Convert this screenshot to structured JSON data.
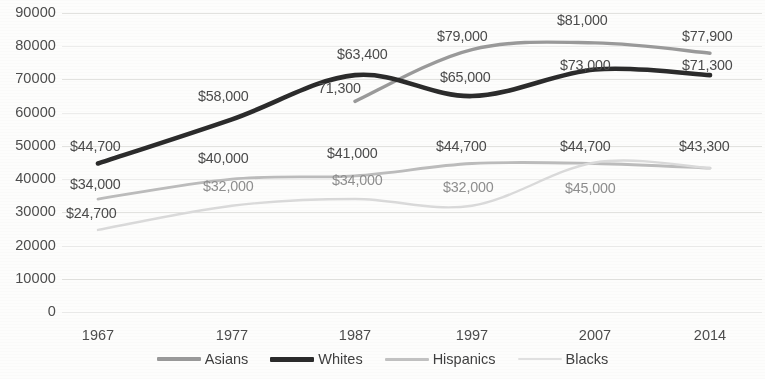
{
  "chart_data": {
    "type": "line",
    "title": "",
    "xlabel": "",
    "ylabel": "",
    "categories": [
      "1967",
      "1977",
      "1987",
      "1997",
      "2007",
      "2014"
    ],
    "ylim": [
      0,
      90000
    ],
    "ytick_values": [
      90000,
      80000,
      70000,
      60000,
      50000,
      40000,
      30000,
      20000,
      10000,
      0
    ],
    "ytick_labels": [
      "90000",
      "80000",
      "70000",
      "60000",
      "50000",
      "40000",
      "30000",
      "20000",
      "10000",
      "0"
    ],
    "grid": true,
    "legend_position": "bottom",
    "series": [
      {
        "name": "Asians",
        "color": "#9a9a9a",
        "width": 3.4,
        "values": [
          null,
          null,
          63400,
          79000,
          81000,
          77900
        ],
        "labels": [
          "",
          "",
          "$63,400",
          "$79,000",
          "$81,000",
          "$77,900"
        ]
      },
      {
        "name": "Whites",
        "color": "#2b2b2b",
        "width": 4.6,
        "values": [
          44700,
          58000,
          71300,
          65000,
          73000,
          71300
        ],
        "labels": [
          "$44,700",
          "$58,000",
          "71,300",
          "$65,000",
          "$73,000",
          "$71,300"
        ]
      },
      {
        "name": "Hispanics",
        "color": "#bcbcbc",
        "width": 2.8,
        "values": [
          34000,
          40000,
          41000,
          44700,
          44700,
          43300
        ],
        "labels": [
          "$34,000",
          "$40,000",
          "$41,000",
          "$44,700",
          "$44,700",
          "$43,300"
        ]
      },
      {
        "name": "Blacks",
        "color": "#dadada",
        "width": 2.4,
        "values": [
          24700,
          32000,
          34000,
          32000,
          45000,
          43300
        ],
        "labels": [
          "$24,700",
          "$32,000",
          "$34,000",
          "$32,000",
          "$45,000",
          ""
        ]
      }
    ],
    "annotations": [
      {
        "text": "$44,700",
        "x": 70,
        "y": 138,
        "tone": "dark"
      },
      {
        "text": "$34,000",
        "x": 70,
        "y": 176,
        "tone": "dark"
      },
      {
        "text": "$24,700",
        "x": 66,
        "y": 205,
        "tone": "dark"
      },
      {
        "text": "$58,000",
        "x": 198,
        "y": 88,
        "tone": "dark"
      },
      {
        "text": "$40,000",
        "x": 198,
        "y": 150,
        "tone": "dark"
      },
      {
        "text": "$32,000",
        "x": 203,
        "y": 178,
        "tone": "light"
      },
      {
        "text": "$63,400",
        "x": 337,
        "y": 46,
        "tone": "dark"
      },
      {
        "text": "71,300",
        "x": 318,
        "y": 80,
        "tone": "dark"
      },
      {
        "text": "$41,000",
        "x": 327,
        "y": 145,
        "tone": "dark"
      },
      {
        "text": "$34,000",
        "x": 332,
        "y": 172,
        "tone": "light"
      },
      {
        "text": "$79,000",
        "x": 437,
        "y": 28,
        "tone": "dark"
      },
      {
        "text": "$65,000",
        "x": 440,
        "y": 69,
        "tone": "dark"
      },
      {
        "text": "$44,700",
        "x": 436,
        "y": 138,
        "tone": "dark"
      },
      {
        "text": "$32,000",
        "x": 443,
        "y": 179,
        "tone": "light"
      },
      {
        "text": "$81,000",
        "x": 557,
        "y": 12,
        "tone": "dark"
      },
      {
        "text": "$73,000",
        "x": 560,
        "y": 57,
        "tone": "dark"
      },
      {
        "text": "$44,700",
        "x": 560,
        "y": 138,
        "tone": "dark"
      },
      {
        "text": "$45,000",
        "x": 565,
        "y": 180,
        "tone": "light"
      },
      {
        "text": "$77,900",
        "x": 682,
        "y": 28,
        "tone": "dark"
      },
      {
        "text": "$71,300",
        "x": 682,
        "y": 57,
        "tone": "dark"
      },
      {
        "text": "$43,300",
        "x": 679,
        "y": 138,
        "tone": "dark"
      }
    ]
  },
  "legend": {
    "items": [
      {
        "label": "Asians",
        "color": "#9a9a9a"
      },
      {
        "label": "Whites",
        "color": "#2b2b2b"
      },
      {
        "label": "Hispanics",
        "color": "#c2c2c2"
      },
      {
        "label": "Blacks",
        "color": "#e0e0e0"
      }
    ]
  }
}
